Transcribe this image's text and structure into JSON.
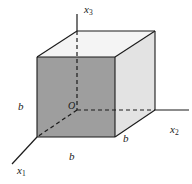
{
  "figure": {
    "background_color": "#ffffff",
    "line_color": "#1b1b1b",
    "faces": {
      "front_left": {
        "name": "front-left-face",
        "fill": "#9e9e9e"
      },
      "right": {
        "name": "right-face",
        "fill": "#e3e3e3"
      },
      "top": {
        "name": "top-face",
        "fill": "#f4f4f4"
      }
    },
    "axes": [
      {
        "id": "x3",
        "base": "x",
        "subscript": "3",
        "label": "x3",
        "direction": "up",
        "style": "solid"
      },
      {
        "id": "x2",
        "base": "x",
        "subscript": "2",
        "label": "x2",
        "direction": "right",
        "style": "solid"
      },
      {
        "id": "x1",
        "base": "x",
        "subscript": "1",
        "label": "x1",
        "direction": "lower-left",
        "style": "solid"
      }
    ],
    "origin": {
      "label": "O",
      "name": "origin-label"
    },
    "edge_labels": [
      {
        "id": "b-left",
        "text": "b",
        "edge": "vertical-left-edge"
      },
      {
        "id": "b-bottom",
        "text": "b",
        "edge": "bottom-front-edge"
      },
      {
        "id": "b-right",
        "text": "b",
        "edge": "bottom-right-receding-edge"
      }
    ],
    "hidden_edges": {
      "style": "dashed",
      "count": 3,
      "note": "dashed segments meeting at the origin represent the hidden back corner axes"
    }
  }
}
